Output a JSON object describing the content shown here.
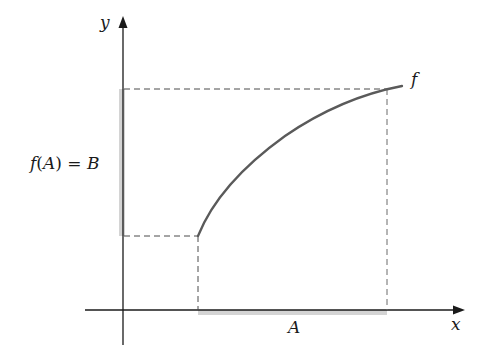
{
  "diagram": {
    "title": "",
    "axes": {
      "x_label": "x",
      "y_label": "y"
    },
    "function_label": "f",
    "image_label": {
      "f": "f",
      "open": "(",
      "arg": "A",
      "close": ")",
      "equals": " = ",
      "result": "B"
    },
    "domain_label": "A",
    "colors": {
      "axis": "#1a1a1a",
      "curve": "#5a5a5a",
      "dashed": "#4a4a4a",
      "shade": "#c8c8c8",
      "text": "#1a1a1a"
    },
    "geometry": {
      "origin": [
        123,
        310
      ],
      "x_axis": {
        "from": 85,
        "to": 463
      },
      "y_axis": {
        "from": 345,
        "to": 17
      },
      "domain_interval_px": [
        198,
        387
      ],
      "range_interval_px": [
        89,
        236
      ],
      "curve_points": [
        [
          198,
          236
        ],
        [
          208,
          212
        ],
        [
          222,
          192
        ],
        [
          240,
          172
        ],
        [
          262,
          152
        ],
        [
          290,
          132
        ],
        [
          320,
          114
        ],
        [
          355,
          99
        ],
        [
          387,
          89
        ],
        [
          402,
          86
        ]
      ]
    }
  }
}
